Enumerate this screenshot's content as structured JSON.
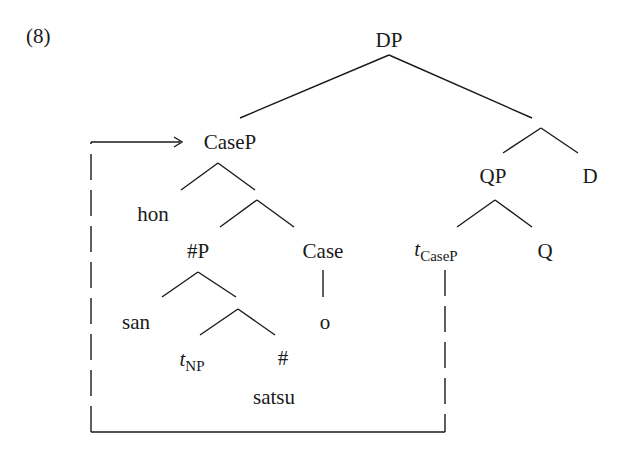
{
  "example_number": "(8)",
  "nodes": {
    "dp": "DP",
    "casep": "CaseP",
    "hon": "hon",
    "numP": "#P",
    "case": "Case",
    "san": "san",
    "o": "o",
    "t_np_main": "t",
    "t_np_sub": "NP",
    "num": "#",
    "satsu": "satsu",
    "qp": "QP",
    "d": "D",
    "t_casep_main": "t",
    "t_casep_sub": "CaseP",
    "q": "Q"
  },
  "colors": {
    "line": "#1a1a1a",
    "background": "#ffffff"
  }
}
